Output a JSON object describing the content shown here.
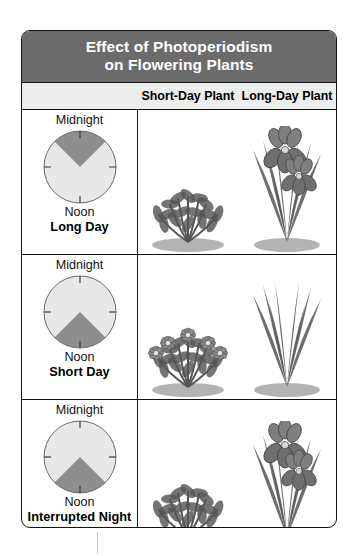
{
  "title": {
    "line1": "Effect of Photoperiodism",
    "line2": "on Flowering Plants"
  },
  "colors": {
    "title_bar": "#6b6b6b",
    "header_row": "#eceded",
    "night_wedge": "#8e8e8e",
    "day_wedge": "#e8e8e8",
    "border": "#111111",
    "plant_ink": "#555555"
  },
  "columns": {
    "left_label": "",
    "short_day_plant": "Short-Day Plant",
    "long_day_plant": "Long-Day Plant"
  },
  "rows": [
    {
      "id": "long-day",
      "top_label": "Midnight",
      "bottom_label": "Noon",
      "name": "Long Day",
      "clock": {
        "night_start_deg": 315,
        "night_end_deg": 45,
        "night_hours": 6,
        "day_hours": 18,
        "light_flash": false
      },
      "short_day_plant": {
        "flowering": false,
        "type": "bush"
      },
      "long_day_plant": {
        "flowering": true,
        "type": "iris"
      }
    },
    {
      "id": "short-day",
      "top_label": "Midnight",
      "bottom_label": "Noon",
      "name": "Short Day",
      "clock": {
        "night_start_deg": 135,
        "night_end_deg": 225,
        "night_hours": 18,
        "day_hours": 6,
        "light_flash": false
      },
      "short_day_plant": {
        "flowering": true,
        "type": "bush"
      },
      "long_day_plant": {
        "flowering": false,
        "type": "iris"
      }
    },
    {
      "id": "interrupted-night",
      "top_label": "Midnight",
      "bottom_label": "Noon",
      "name": "Interrupted Night",
      "clock": {
        "night_start_deg": 135,
        "night_end_deg": 225,
        "night_hours": 18,
        "day_hours": 6,
        "light_flash": true,
        "flash_start_deg": 3,
        "flash_end_deg": 14
      },
      "short_day_plant": {
        "flowering": false,
        "type": "bush"
      },
      "long_day_plant": {
        "flowering": true,
        "type": "iris"
      }
    }
  ]
}
